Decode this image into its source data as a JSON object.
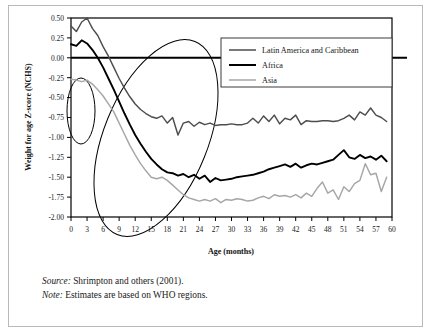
{
  "figure": {
    "source_label": "Source:",
    "source_text": " Shrimpton and others (2001).",
    "note_label": "Note:",
    "note_text": " Estimates are based on WHO regions."
  },
  "colors": {
    "latin_america": "#4d4d4d",
    "africa": "#000000",
    "asia": "#a6a6a6",
    "axis": "#000000",
    "frame": "#b9b9b9",
    "annotation": "#000000"
  },
  "legend": {
    "position": "top-right",
    "entries": [
      {
        "label": "Latin America and Caribbean",
        "color": "#4d4d4d",
        "width": 1.5
      },
      {
        "label": "Africa",
        "color": "#000000",
        "width": 2.0
      },
      {
        "label": "Asia",
        "color": "#a6a6a6",
        "width": 1.5
      }
    ]
  },
  "annotations": [
    {
      "name": "small-ellipse-origin",
      "cx": 10,
      "cy": 93,
      "rx": 14,
      "ry": 33,
      "rotate": 0
    },
    {
      "name": "large-ellipse-growth-faltering",
      "cx": 85,
      "cy": 120,
      "rx": 52,
      "ry": 104,
      "rotate": 22
    }
  ],
  "chart_data": {
    "type": "line",
    "title": "",
    "xlabel": "Age (months)",
    "ylabel": "Weight for age Z-score (NCHS)",
    "xlim": [
      0,
      60
    ],
    "ylim": [
      -2.0,
      0.5
    ],
    "xticks": [
      0,
      3,
      6,
      9,
      12,
      15,
      18,
      21,
      24,
      27,
      30,
      33,
      36,
      39,
      42,
      45,
      48,
      51,
      54,
      57,
      60
    ],
    "yticks": [
      0.5,
      0.25,
      0.0,
      -0.25,
      -0.5,
      -0.75,
      -1.0,
      -1.25,
      -1.5,
      -1.75,
      -2.0
    ],
    "ytick_labels": [
      "0.50",
      "0.25",
      "0.00",
      "-0.25",
      "-0.50",
      "-0.75",
      "-1.00",
      "-1.25",
      "-1.50",
      "-1.75",
      "-2.00"
    ],
    "grid": false,
    "zero_line": true,
    "x": [
      0,
      1,
      2,
      3,
      4,
      5,
      6,
      7,
      8,
      9,
      10,
      11,
      12,
      13,
      14,
      15,
      16,
      17,
      18,
      19,
      20,
      21,
      22,
      23,
      24,
      25,
      26,
      27,
      28,
      29,
      30,
      31,
      32,
      33,
      34,
      35,
      36,
      37,
      38,
      39,
      40,
      41,
      42,
      43,
      44,
      45,
      46,
      47,
      48,
      49,
      50,
      51,
      52,
      53,
      54,
      55,
      56,
      57,
      58,
      59
    ],
    "series": [
      {
        "name": "Latin America and Caribbean",
        "color": "#4d4d4d",
        "values": [
          0.4,
          0.33,
          0.45,
          0.5,
          0.37,
          0.28,
          0.14,
          0.02,
          -0.12,
          -0.26,
          -0.38,
          -0.49,
          -0.58,
          -0.65,
          -0.7,
          -0.74,
          -0.76,
          -0.73,
          -0.82,
          -0.75,
          -0.97,
          -0.82,
          -0.8,
          -0.86,
          -0.81,
          -0.84,
          -0.82,
          -0.85,
          -0.84,
          -0.84,
          -0.83,
          -0.84,
          -0.84,
          -0.82,
          -0.76,
          -0.82,
          -0.73,
          -0.8,
          -0.72,
          -0.83,
          -0.76,
          -0.78,
          -0.72,
          -0.84,
          -0.79,
          -0.8,
          -0.8,
          -0.79,
          -0.79,
          -0.8,
          -0.79,
          -0.76,
          -0.72,
          -0.78,
          -0.68,
          -0.72,
          -0.63,
          -0.72,
          -0.75,
          -0.8
        ]
      },
      {
        "name": "Africa",
        "color": "#000000",
        "values": [
          0.17,
          0.15,
          0.22,
          0.18,
          0.1,
          0.0,
          -0.12,
          -0.26,
          -0.4,
          -0.55,
          -0.7,
          -0.84,
          -0.97,
          -1.08,
          -1.18,
          -1.27,
          -1.34,
          -1.4,
          -1.44,
          -1.45,
          -1.48,
          -1.46,
          -1.5,
          -1.47,
          -1.52,
          -1.48,
          -1.56,
          -1.51,
          -1.54,
          -1.53,
          -1.52,
          -1.5,
          -1.49,
          -1.48,
          -1.47,
          -1.45,
          -1.43,
          -1.4,
          -1.38,
          -1.36,
          -1.34,
          -1.37,
          -1.33,
          -1.38,
          -1.35,
          -1.33,
          -1.34,
          -1.32,
          -1.3,
          -1.28,
          -1.22,
          -1.16,
          -1.25,
          -1.27,
          -1.22,
          -1.26,
          -1.24,
          -1.28,
          -1.23,
          -1.3
        ]
      },
      {
        "name": "Asia",
        "color": "#a6a6a6",
        "values": [
          -0.27,
          -0.28,
          -0.3,
          -0.28,
          -0.33,
          -0.4,
          -0.48,
          -0.58,
          -0.68,
          -0.82,
          -0.96,
          -1.1,
          -1.22,
          -1.33,
          -1.42,
          -1.5,
          -1.52,
          -1.5,
          -1.54,
          -1.6,
          -1.66,
          -1.72,
          -1.76,
          -1.78,
          -1.8,
          -1.78,
          -1.8,
          -1.77,
          -1.82,
          -1.78,
          -1.79,
          -1.77,
          -1.78,
          -1.8,
          -1.79,
          -1.76,
          -1.74,
          -1.77,
          -1.72,
          -1.74,
          -1.73,
          -1.75,
          -1.72,
          -1.76,
          -1.7,
          -1.74,
          -1.64,
          -1.56,
          -1.7,
          -1.66,
          -1.78,
          -1.62,
          -1.68,
          -1.58,
          -1.54,
          -1.33,
          -1.47,
          -1.45,
          -1.68,
          -1.5
        ]
      }
    ]
  }
}
